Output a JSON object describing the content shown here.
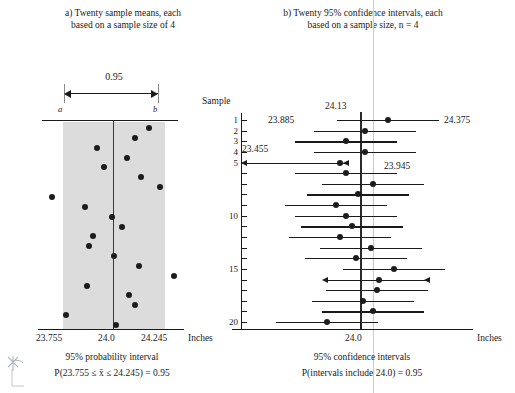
{
  "figure": {
    "units": "Inches",
    "panel_a": {
      "caption_line1": "a) Twenty sample means, each",
      "caption_line2": "based on a sample size of 4",
      "bracket_label": "0.95",
      "endpoint_a_label": "a",
      "endpoint_b_label": "b",
      "axis_ticks": [
        "23.755",
        "24.0",
        "24.245"
      ],
      "units_label": "Inches",
      "footer_line1": "95% probability interval",
      "footer_line2": "P(23.755 ≤ x̄ ≤ 24.245) = 0.95"
    },
    "panel_b": {
      "caption_line1": "b) Twenty 95% confidence intervals, each",
      "caption_line2": "based on a sample size, n = 4",
      "y_axis_title": "Sample",
      "y_tick_labels": [
        "1",
        "2",
        "3",
        "4",
        "5",
        "10",
        "15",
        "20"
      ],
      "axis_ticks": [
        "24.0"
      ],
      "units_label": "Inches",
      "footer_line1": "95% confidence intervals",
      "footer_line2": "P(intervals include 24.0) = 0.95",
      "annotations": [
        {
          "text": "24.13",
          "sample": 1
        },
        {
          "text": "23.885",
          "sample": 1
        },
        {
          "text": "24.375",
          "sample": 1
        },
        {
          "text": "23.455",
          "sample": 5
        },
        {
          "text": "23.945",
          "sample": 5
        }
      ]
    }
  },
  "chart_data": {
    "type": "scatter",
    "xlabel": "Inches",
    "ylabel": "Sample",
    "grid": false,
    "legend": null,
    "panel_a": {
      "type": "scatter",
      "title": "a) Twenty sample means, each based on a sample size of 4",
      "xlabel": "Inches",
      "xlim": [
        23.66,
        24.34
      ],
      "probability_interval": [
        23.755,
        24.245
      ],
      "center": 24.0,
      "confidence": 0.95,
      "sample_means": [
        24.17,
        24.1,
        23.92,
        24.06,
        23.95,
        24.13,
        24.22,
        23.7,
        23.86,
        23.99,
        24.04,
        23.9,
        23.88,
        24.0,
        24.12,
        24.29,
        23.87,
        24.07,
        24.1,
        23.77,
        24.01
      ]
    },
    "panel_b": {
      "type": "errorbar",
      "title": "b) Twenty 95% confidence intervals, each based on a sample size, n = 4",
      "xlabel": "Inches",
      "ylabel": "Sample",
      "xlim": [
        23.4,
        24.5
      ],
      "reference_line": 24.0,
      "confidence": 0.95,
      "samples": [
        1,
        2,
        3,
        4,
        5,
        6,
        7,
        8,
        9,
        10,
        11,
        12,
        13,
        14,
        15,
        16,
        17,
        18,
        19,
        20
      ],
      "centers": [
        24.13,
        24.02,
        23.93,
        24.02,
        23.9,
        23.93,
        24.06,
        23.99,
        23.88,
        23.93,
        23.96,
        23.9,
        24.05,
        23.98,
        24.16,
        24.09,
        24.08,
        24.01,
        24.06,
        23.84
      ],
      "lower": [
        23.885,
        23.775,
        23.685,
        23.775,
        23.455,
        23.685,
        23.815,
        23.745,
        23.635,
        23.685,
        23.715,
        23.655,
        23.805,
        23.735,
        23.915,
        23.845,
        23.835,
        23.765,
        23.815,
        23.595
      ],
      "upper": [
        24.375,
        24.265,
        24.175,
        24.265,
        23.945,
        24.175,
        24.305,
        24.235,
        24.125,
        24.175,
        24.205,
        24.145,
        24.295,
        24.225,
        24.405,
        24.335,
        24.325,
        24.255,
        24.305,
        24.085
      ],
      "misses_reference": [
        5,
        16
      ],
      "includes_reference_count": 19
    }
  }
}
